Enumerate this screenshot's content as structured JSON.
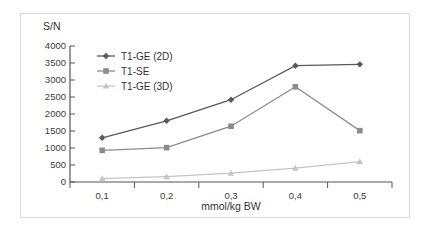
{
  "chart_data": {
    "type": "line",
    "title": "",
    "xlabel": "mmol/kg BW",
    "ylabel": "S/N",
    "categories": [
      "0,1",
      "0,2",
      "0,3",
      "0,4",
      "0,5"
    ],
    "x": [
      0.1,
      0.2,
      0.3,
      0.4,
      0.5
    ],
    "ylim": [
      0,
      4000
    ],
    "ytick_labels": [
      "4000",
      "3500",
      "3000",
      "2500",
      "2000",
      "1500",
      "1000",
      "500",
      "0"
    ],
    "ytick_values": [
      4000,
      3500,
      3000,
      2500,
      2000,
      1500,
      1000,
      500,
      0
    ],
    "grid": false,
    "legend_position": "inside-top-left",
    "series": [
      {
        "name": "T1-GE (2D)",
        "marker": "diamond",
        "color": "#595959",
        "values": [
          1300,
          1800,
          2420,
          3420,
          3460
        ]
      },
      {
        "name": "T1-SE",
        "marker": "square",
        "color": "#8c8c8c",
        "values": [
          930,
          1010,
          1640,
          2800,
          1510
        ]
      },
      {
        "name": "T1-GE (3D)",
        "marker": "triangle",
        "color": "#c4c4c4",
        "values": [
          100,
          160,
          260,
          410,
          600
        ]
      }
    ]
  },
  "axis": {
    "y_label": "S/N",
    "x_title": "mmol/kg BW"
  },
  "colors": {
    "series1": "#595959",
    "series2": "#8c8c8c",
    "series3": "#c4c4c4",
    "axis": "#555555",
    "border": "#d9d9d9",
    "text": "#333333"
  }
}
